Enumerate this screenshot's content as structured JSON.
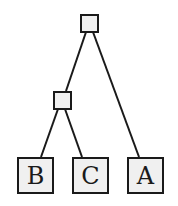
{
  "diagram": {
    "type": "tree",
    "colors": {
      "stroke": "#1a1a1a",
      "fill": "#f0f0f0",
      "background": "#ffffff"
    },
    "nodes": [
      {
        "id": "root",
        "label": "",
        "kind": "internal"
      },
      {
        "id": "mid",
        "label": "",
        "kind": "internal"
      },
      {
        "id": "B",
        "label": "B",
        "kind": "leaf"
      },
      {
        "id": "C",
        "label": "C",
        "kind": "leaf"
      },
      {
        "id": "A",
        "label": "A",
        "kind": "leaf"
      }
    ],
    "edges": [
      {
        "from": "root",
        "to": "mid"
      },
      {
        "from": "root",
        "to": "A"
      },
      {
        "from": "mid",
        "to": "B"
      },
      {
        "from": "mid",
        "to": "C"
      }
    ]
  }
}
